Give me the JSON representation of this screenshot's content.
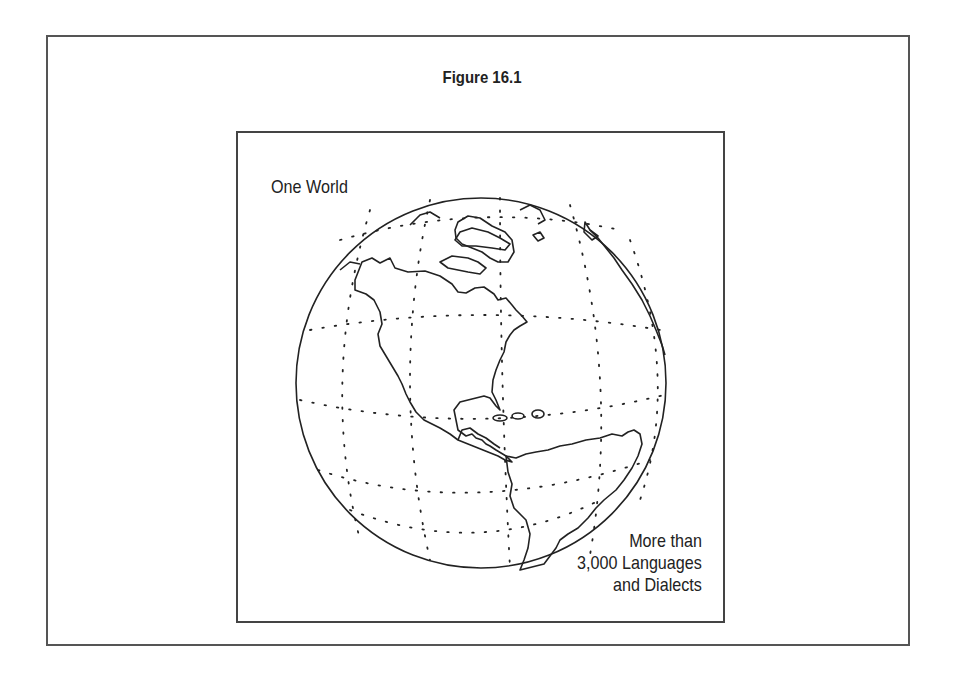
{
  "figure": {
    "title": "Figure 16.1",
    "caption_top_left": "One World",
    "caption_bottom_right": [
      "More than",
      "3,000 Languages",
      "and Dialects"
    ]
  },
  "illustration": {
    "subject": "globe-western-hemisphere",
    "features": [
      "north-america",
      "south-america",
      "greenland",
      "caribbean-islands",
      "dotted-latitude-longitude-grid"
    ],
    "line_color": "#222222",
    "background": "#ffffff"
  }
}
